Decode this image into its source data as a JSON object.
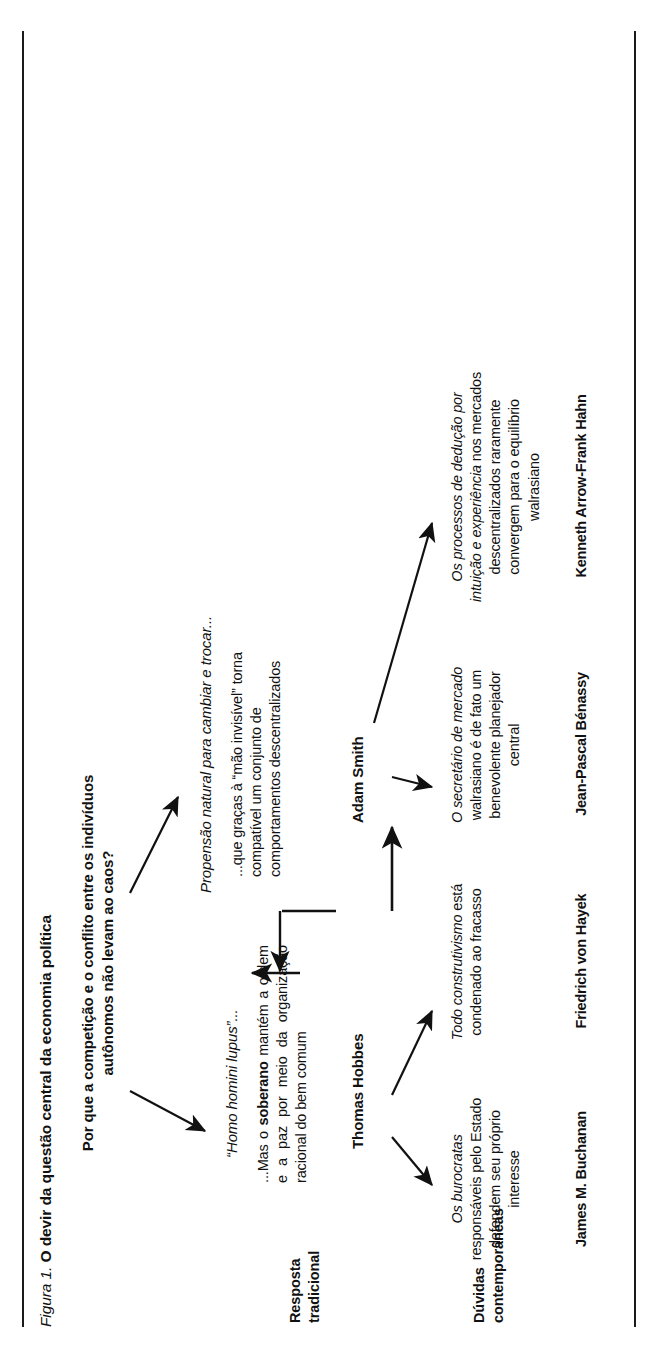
{
  "figure": {
    "caption_prefix": "Figura 1.",
    "caption_title": "O devir da questão central da economia política",
    "question": "Por que a competição e o conflito entre os indivíduos autônomos não levam ao caos?"
  },
  "row_labels": {
    "traditional": "Resposta\ntradicional",
    "traditional_line1": "Resposta",
    "traditional_line2": "tradicional",
    "contemporary_line1": "Dúvidas",
    "contemporary_line2": "contemporâneas"
  },
  "premises": {
    "hobbes_premise": "“Homo homini lupus”...",
    "smith_premise": "Propensão natural para cambiar e trocar..."
  },
  "traditional": [
    {
      "id": "hobbes",
      "statement_plain_1": "...Mas o ",
      "statement_bold": "soberano",
      "statement_plain_2": " mantém a ordem e a paz por meio da organização racional do bem comum",
      "thinker": "Thomas Hobbes"
    },
    {
      "id": "smith",
      "statement_full": "...que graças à “mão invisível” torna compatível um conjunto de comportamentos descentralizados",
      "thinker": "Adam Smith"
    }
  ],
  "contemporary": [
    {
      "id": "buchanan",
      "italic_part": "Os burocratas",
      "rest": " responsáveis pelo Estado defendem seu próprio interesse",
      "full": "Os burocratas responsáveis pelo Estado defendem seu próprio interesse",
      "name": "James M. Buchanan"
    },
    {
      "id": "hayek",
      "italic_part": "Todo construtivismo",
      "rest": " está condenado ao fracasso",
      "full": "Todo construtivismo está condenado ao fracasso",
      "name": "Friedrich von Hayek"
    },
    {
      "id": "benassy",
      "italic_part": "O secretário de mercado",
      "rest": " walrasiano é de fato um benevolente planejador central",
      "full": "O secretário de mercado walrasiano é de fato um benevolente planejador central",
      "name": "Jean-Pascal Bénassy"
    },
    {
      "id": "arrow-hahn",
      "italic_part": "Os processos de dedução por intuição e experiência",
      "rest": " nos mercados descentralizados raramente convergem para o equilíbrio walrasiano",
      "full": "Os processos de dedução por intuição e experiência nos mercados descentralizados raramente convergem para o equilíbrio walrasiano",
      "name": "Kenneth Arrow-Frank Hahn"
    }
  ],
  "colors": {
    "ink": "#111111",
    "background": "#ffffff",
    "rule": "#1a1a1a"
  }
}
